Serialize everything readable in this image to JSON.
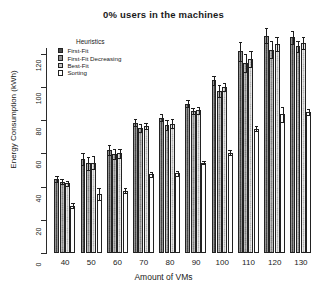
{
  "chart_data": {
    "type": "bar",
    "title": "0% users in the machines",
    "xlabel": "Amount of VMs",
    "ylabel": "Energy Consumption (kWh)",
    "categories": [
      "40",
      "50",
      "60",
      "70",
      "80",
      "90",
      "100",
      "110",
      "120",
      "130"
    ],
    "yticks": [
      "0",
      "20",
      "40",
      "60",
      "80",
      "100",
      "120"
    ],
    "ylim": [
      0,
      132
    ],
    "grid": false,
    "legend_title": "Heuristics",
    "legend_position": "top-left inside",
    "series": [
      {
        "name": "First-Fit",
        "color": "#4a4a4a",
        "values": [
          44.5,
          56.5,
          62.0,
          78.5,
          81.5,
          90.0,
          104.0,
          121.5,
          131.0,
          130.0
        ],
        "errors": [
          2.0,
          3.5,
          3.0,
          2.0,
          2.0,
          2.0,
          2.5,
          5.5,
          4.5,
          4.0
        ]
      },
      {
        "name": "First-Fit Decreasing",
        "color": "#8f8f8f",
        "values": [
          43.0,
          54.0,
          59.5,
          75.5,
          77.0,
          85.5,
          97.5,
          114.5,
          122.5,
          124.5
        ],
        "errors": [
          1.5,
          4.0,
          3.0,
          2.5,
          3.0,
          2.0,
          3.5,
          5.5,
          5.0,
          3.5
        ]
      },
      {
        "name": "Best-Fit",
        "color": "#c3c3c3",
        "values": [
          42.0,
          54.5,
          60.0,
          76.5,
          78.0,
          86.0,
          100.0,
          117.0,
          126.0,
          126.5
        ],
        "errors": [
          1.5,
          4.0,
          2.5,
          2.0,
          2.5,
          2.0,
          2.5,
          5.0,
          4.0,
          3.5
        ]
      },
      {
        "name": "Sorting",
        "color": "#ffffff",
        "values": [
          28.5,
          35.5,
          37.5,
          47.5,
          48.0,
          54.5,
          60.5,
          75.0,
          83.5,
          85.0
        ],
        "errors": [
          1.5,
          3.5,
          1.5,
          1.5,
          1.5,
          1.0,
          1.5,
          1.5,
          4.5,
          2.0
        ]
      }
    ]
  }
}
